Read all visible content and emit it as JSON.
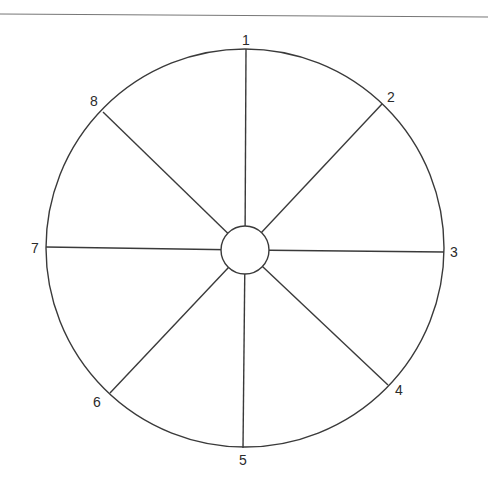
{
  "diagram": {
    "type": "segmented-wheel",
    "segment_count": 8,
    "stroke_color": "#3a3a3a",
    "background": "#ffffff",
    "top_rule": {
      "x1": 0,
      "y1": 14,
      "x2": 488,
      "y2": 17,
      "color": "#777777"
    },
    "outer_circle": {
      "cx": 245,
      "cy": 248,
      "r": 199
    },
    "hub_circle": {
      "cx": 245,
      "cy": 250,
      "r": 24
    },
    "spokes": [
      {
        "label": "1",
        "outer": [
          246,
          49
        ],
        "label_pos": [
          246,
          45
        ]
      },
      {
        "label": "2",
        "outer": [
          382,
          104
        ],
        "label_pos": [
          391,
          102
        ]
      },
      {
        "label": "3",
        "outer": [
          444,
          252
        ],
        "label_pos": [
          454,
          257
        ]
      },
      {
        "label": "4",
        "outer": [
          388,
          385
        ],
        "label_pos": [
          399,
          395
        ]
      },
      {
        "label": "5",
        "outer": [
          243,
          448
        ],
        "label_pos": [
          243,
          465
        ]
      },
      {
        "label": "6",
        "outer": [
          110,
          393
        ],
        "label_pos": [
          97,
          407
        ]
      },
      {
        "label": "7",
        "outer": [
          46,
          247
        ],
        "label_pos": [
          35,
          253
        ]
      },
      {
        "label": "8",
        "outer": [
          103,
          112
        ],
        "label_pos": [
          94,
          106
        ]
      }
    ]
  }
}
